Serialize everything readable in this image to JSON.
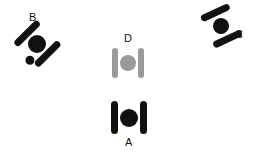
{
  "canvas": {
    "width": 257,
    "height": 154,
    "background": "#ffffff"
  },
  "palette": {
    "black": "#111111",
    "gray": "#9a9a9a",
    "label_color": "#141414"
  },
  "objects": [
    {
      "id": "A",
      "label": "A",
      "color": "#111111",
      "color_name": "black",
      "orientation_deg": 0,
      "label_position": "below",
      "description": "two vertical bars flanking a filled circle, upright",
      "has_extra_dot": false,
      "center": {
        "x": 129,
        "y": 118
      },
      "label_xy": {
        "x": 125,
        "y": 137
      },
      "parts": {
        "left_bar": {
          "x": -18,
          "y": -17,
          "w": 7,
          "h": 33
        },
        "right_bar": {
          "x": 11,
          "y": -17,
          "w": 7,
          "h": 33
        },
        "circle": {
          "x": -9,
          "y": -9,
          "d": 18
        }
      }
    },
    {
      "id": "B",
      "label": "B",
      "color": "#111111",
      "color_name": "black",
      "orientation_deg": 45,
      "label_position": "above",
      "description": "same bar-circle-bar shape rotated about 45 degrees counter-clockwise, with an extra small dot at lower right",
      "has_extra_dot": true,
      "center": {
        "x": 37,
        "y": 44
      },
      "label_xy": {
        "x": 29,
        "y": 12
      },
      "parts": {
        "left_bar": {
          "x": -18,
          "y": -17,
          "w": 7,
          "h": 33
        },
        "right_bar": {
          "x": 11,
          "y": -17,
          "w": 7,
          "h": 33
        },
        "circle": {
          "x": -9,
          "y": -9,
          "d": 18
        },
        "extra_dot": {
          "x": 2,
          "y": 12,
          "d": 9
        }
      }
    },
    {
      "id": "C",
      "label": "C",
      "color": "#111111",
      "color_name": "black",
      "orientation_deg": 65,
      "label_position": "right",
      "description": "same bar-circle-bar shape rotated about 65 degrees, tilted to the right",
      "has_extra_dot": false,
      "center": {
        "x": 221,
        "y": 26
      },
      "label_xy": {
        "x": 235,
        "y": 29
      },
      "parts": {
        "left_bar": {
          "x": -18,
          "y": -16,
          "w": 7,
          "h": 31
        },
        "right_bar": {
          "x": 11,
          "y": -16,
          "w": 7,
          "h": 31
        },
        "circle": {
          "x": -8,
          "y": -8,
          "d": 16
        }
      }
    },
    {
      "id": "D",
      "label": "D",
      "color": "#9a9a9a",
      "color_name": "gray",
      "orientation_deg": 0,
      "label_position": "above",
      "description": "two vertical bars flanking a filled circle, upright, rendered in gray",
      "has_extra_dot": false,
      "center": {
        "x": 128,
        "y": 63
      },
      "label_xy": {
        "x": 124,
        "y": 33
      },
      "parts": {
        "left_bar": {
          "x": -16,
          "y": -15,
          "w": 6,
          "h": 30
        },
        "right_bar": {
          "x": 10,
          "y": -15,
          "w": 6,
          "h": 30
        },
        "circle": {
          "x": -8,
          "y": -8,
          "d": 16
        }
      }
    }
  ]
}
